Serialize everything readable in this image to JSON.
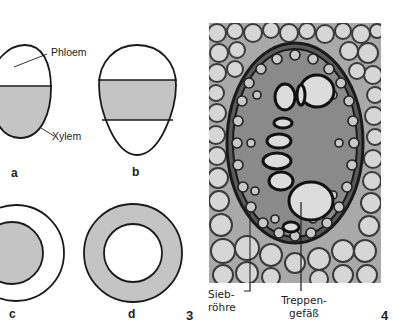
{
  "figure3": {
    "number": "3",
    "panels": [
      {
        "letter": "a",
        "description": "oval, upper white phloem, lower gray xylem"
      },
      {
        "letter": "b",
        "description": "oval, gray xylem band between white phloem top and bottom"
      },
      {
        "letter": "c",
        "description": "circle, gray xylem core, white phloem ring"
      },
      {
        "letter": "d",
        "description": "circle, gray xylem ring, white phloem core"
      }
    ],
    "labels": {
      "phloem": "Phloem",
      "xylem": "Xylem"
    },
    "colors": {
      "xylem_fill": "#c4c4c4",
      "phloem_fill": "#ffffff",
      "outline": "#1a1a1a"
    }
  },
  "figure4": {
    "number": "4",
    "description": "micrograph cross-section of concentric vascular bundle",
    "labels": {
      "siebroehre_line1": "Sieb-",
      "siebroehre_line2": "röhre",
      "treppengefaess_line1": "Treppen-",
      "treppengefaess_line2": "gefäß"
    }
  }
}
